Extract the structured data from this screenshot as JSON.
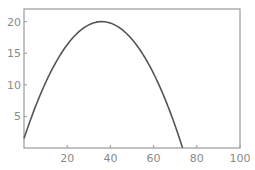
{
  "chart_data": {
    "type": "line",
    "title": "",
    "xlabel": "",
    "ylabel": "",
    "xlim": [
      0,
      100
    ],
    "ylim": [
      0,
      22
    ],
    "grid": false,
    "legend": null,
    "x_ticks": [
      20,
      40,
      60,
      80,
      100
    ],
    "y_ticks": [
      5,
      10,
      15,
      20
    ],
    "x_tick_labels": [
      "20",
      "40",
      "60",
      "80",
      "100"
    ],
    "y_tick_labels": [
      "5",
      "10",
      "15",
      "20"
    ],
    "series": [
      {
        "name": "trajectory",
        "x": [
          0,
          5,
          10,
          15,
          20,
          25,
          30,
          35,
          36,
          40,
          45,
          50,
          55,
          60,
          65,
          70,
          73.4
        ],
        "y": [
          1.5,
          9.8,
          16.4,
          21.0,
          24.0,
          25.5,
          25.5,
          24.0,
          20.0,
          19.8,
          18.8,
          17.2,
          14.9,
          11.8,
          8.0,
          3.5,
          0
        ]
      }
    ],
    "curve_model": {
      "description": "parabolic arc",
      "start_y": 1.5,
      "peak_x": 36,
      "peak_y": 20,
      "zero_x": 73.4
    }
  }
}
